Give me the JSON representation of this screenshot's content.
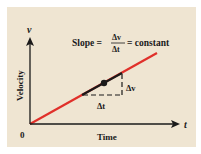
{
  "diagram": {
    "slope_label": "Slope =",
    "slope_numerator": "Δv",
    "slope_denominator": "Δt",
    "slope_suffix": "= constant",
    "y_axis_symbol": "v",
    "x_axis_symbol": "t",
    "y_axis_label": "Velocity",
    "x_axis_label": "Time",
    "origin_label": "0",
    "delta_v_label": "Δv",
    "delta_t_label": "Δt",
    "colors": {
      "background": "#efe5d2",
      "line": "#e0302a",
      "axes": "#1a1a1a",
      "highlight_segment": "#1a1a1a"
    }
  }
}
